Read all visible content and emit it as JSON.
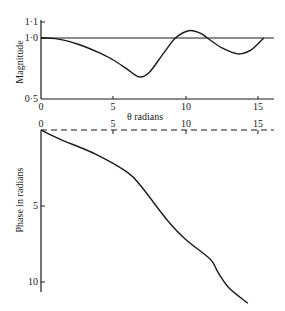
{
  "chart_data": [
    {
      "type": "line",
      "title": "",
      "xlabel": "θ radians",
      "ylabel": "Magnitude",
      "xlim": [
        0,
        16
      ],
      "ylim": [
        0.5,
        1.1
      ],
      "x_ticks": [
        "0",
        "5",
        "10",
        "15"
      ],
      "y_ticks": [
        "0·5",
        "1·0",
        "1·1"
      ],
      "reference_line": {
        "y": 1.0,
        "style": "solid"
      },
      "series": [
        {
          "name": "magnitude",
          "x": [
            0,
            1,
            2,
            3,
            4,
            5,
            6,
            6.8,
            7.5,
            8.5,
            9.3,
            10.2,
            11,
            11.5,
            12.5,
            13.6,
            14.5,
            15.4
          ],
          "y": [
            1.0,
            0.995,
            0.97,
            0.93,
            0.88,
            0.82,
            0.74,
            0.68,
            0.72,
            0.88,
            1.0,
            1.06,
            1.04,
            1.0,
            0.92,
            0.87,
            0.9,
            1.0
          ]
        }
      ]
    },
    {
      "type": "line",
      "title": "",
      "xlabel": "",
      "ylabel": "Phase in radians",
      "xlim": [
        0,
        16
      ],
      "ylim": [
        0,
        11.5
      ],
      "y_inverted": true,
      "x_ticks": [
        "0",
        "5",
        "10",
        "15"
      ],
      "y_ticks": [
        "5",
        "10"
      ],
      "reference_line": {
        "y": 0,
        "style": "dashed"
      },
      "series": [
        {
          "name": "phase",
          "x": [
            0,
            1.3,
            3.8,
            6.0,
            7.0,
            8.7,
            10.0,
            11.7,
            12.2,
            13.0,
            14.3
          ],
          "y": [
            0,
            0.6,
            1.6,
            2.8,
            3.8,
            5.9,
            7.2,
            8.5,
            9.3,
            10.4,
            11.4
          ]
        }
      ]
    }
  ],
  "labels": {
    "mag_ylabel": "Magnitude",
    "phase_ylabel": "Phase in radians",
    "xlabel": "θ radians",
    "mag_yticks": [
      {
        "v": "1·1",
        "y": 22
      },
      {
        "v": "1·0",
        "y": 38
      },
      {
        "v": "0·5",
        "y": 99
      }
    ],
    "phase_yticks": [
      {
        "v": "5",
        "y": 206
      },
      {
        "v": "10",
        "y": 282
      }
    ],
    "xticks": [
      "0",
      "5",
      "10",
      "15"
    ]
  }
}
